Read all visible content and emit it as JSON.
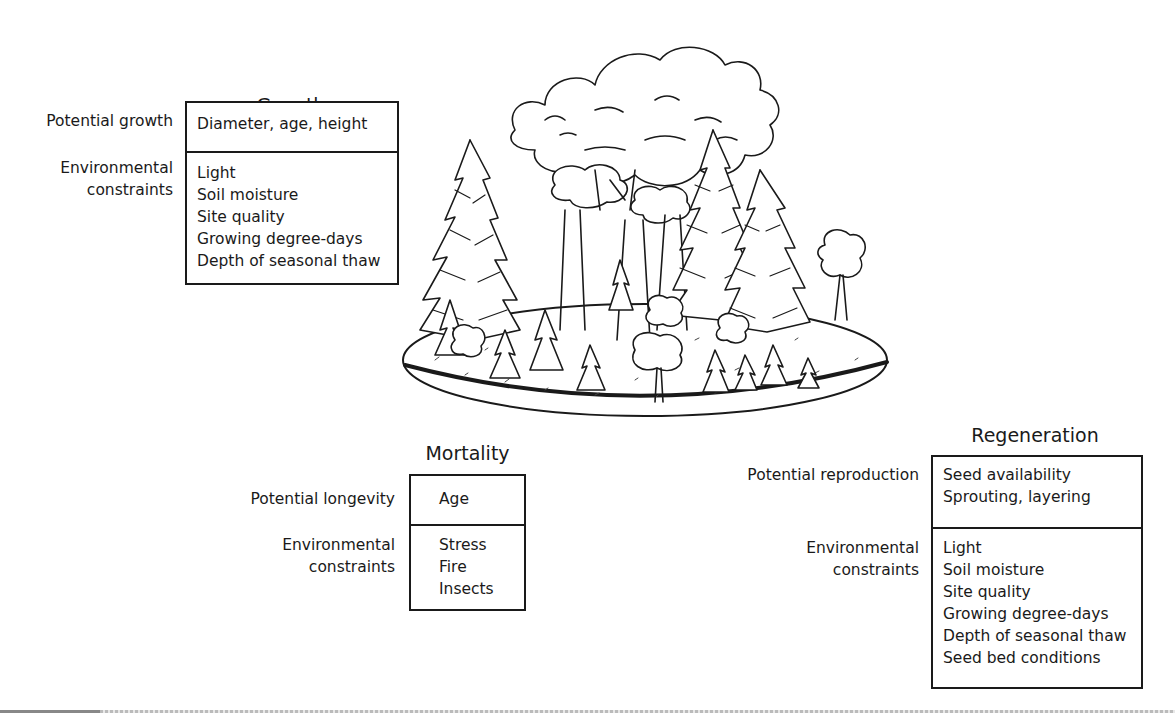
{
  "growth": {
    "title": "Growth",
    "rows": [
      {
        "label": [
          "Potential growth"
        ],
        "items": [
          "Diameter, age, height"
        ]
      },
      {
        "label": [
          "Environmental",
          "constraints"
        ],
        "items": [
          "Light",
          "Soil moisture",
          "Site quality",
          "Growing degree-days",
          "Depth of seasonal thaw"
        ]
      }
    ]
  },
  "mortality": {
    "title": "Mortality",
    "rows": [
      {
        "label": [
          "Potential longevity"
        ],
        "items": [
          "Age"
        ]
      },
      {
        "label": [
          "Environmental",
          "constraints"
        ],
        "items": [
          "Stress",
          "Fire",
          "Insects"
        ]
      }
    ]
  },
  "regeneration": {
    "title": "Regeneration",
    "rows": [
      {
        "label": [
          "Potential reproduction"
        ],
        "items": [
          "Seed availability",
          "Sprouting, layering"
        ]
      },
      {
        "label": [
          "Environmental",
          "constraints"
        ],
        "items": [
          "Light",
          "Soil moisture",
          "Site quality",
          "Growing degree-days",
          "Depth of seasonal thaw",
          "Seed bed conditions"
        ]
      }
    ]
  },
  "illustration": {
    "subject": "forest-stand-illustration"
  }
}
